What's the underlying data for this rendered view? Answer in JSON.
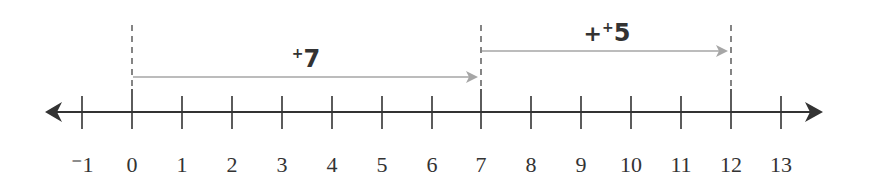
{
  "diagram": {
    "type": "number_line",
    "range": {
      "min": -1,
      "max": 13
    },
    "ticks": [
      {
        "value": -1,
        "label": "⁻1"
      },
      {
        "value": 0,
        "label": "0"
      },
      {
        "value": 1,
        "label": "1"
      },
      {
        "value": 2,
        "label": "2"
      },
      {
        "value": 3,
        "label": "3"
      },
      {
        "value": 4,
        "label": "4"
      },
      {
        "value": 5,
        "label": "5"
      },
      {
        "value": 6,
        "label": "6"
      },
      {
        "value": 7,
        "label": "7"
      },
      {
        "value": 8,
        "label": "8"
      },
      {
        "value": 9,
        "label": "9"
      },
      {
        "value": 10,
        "label": "10"
      },
      {
        "value": 11,
        "label": "11"
      },
      {
        "value": 12,
        "label": "12"
      },
      {
        "value": 13,
        "label": "13"
      }
    ],
    "jumps": [
      {
        "from": 0,
        "to": 7,
        "label_sign": "+",
        "label_value": "7",
        "prefix": ""
      },
      {
        "from": 7,
        "to": 12,
        "label_sign": "+",
        "label_value": "5",
        "prefix": "+"
      }
    ],
    "markers": [
      0,
      7,
      12
    ],
    "colors": {
      "axis": "#333333",
      "jump_arrow": "#a6a6a6",
      "dashed": "#444444"
    }
  }
}
